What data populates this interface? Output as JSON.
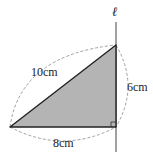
{
  "figure": {
    "type": "geometry-diagram",
    "axis_label": "ℓ",
    "labels": {
      "hypotenuse": "10cm",
      "vertical_leg": "6cm",
      "horizontal_leg": "8cm"
    },
    "colors": {
      "fill": "#b4b4b4",
      "stroke": "#222222",
      "dashed": "#777777"
    }
  }
}
